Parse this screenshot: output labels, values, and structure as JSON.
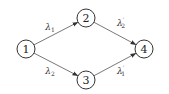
{
  "diagram": {
    "type": "directed-graph",
    "nodes": [
      {
        "id": "1",
        "label": "1",
        "x": 26,
        "y": 49
      },
      {
        "id": "2",
        "label": "2",
        "x": 86,
        "y": 18
      },
      {
        "id": "3",
        "label": "3",
        "x": 86,
        "y": 80
      },
      {
        "id": "4",
        "label": "4",
        "x": 144,
        "y": 49
      }
    ],
    "edges": [
      {
        "from": "1",
        "to": "2",
        "label": "λ",
        "sub": "1",
        "prime": "",
        "lx": 50,
        "ly": 30
      },
      {
        "from": "1",
        "to": "3",
        "label": "λ",
        "sub": "2",
        "prime": "",
        "lx": 50,
        "ly": 74
      },
      {
        "from": "2",
        "to": "4",
        "label": "λ",
        "sub": "2",
        "prime": "′",
        "lx": 121,
        "ly": 26
      },
      {
        "from": "3",
        "to": "4",
        "label": "λ",
        "sub": "1",
        "prime": "′",
        "lx": 121,
        "ly": 74
      }
    ]
  }
}
